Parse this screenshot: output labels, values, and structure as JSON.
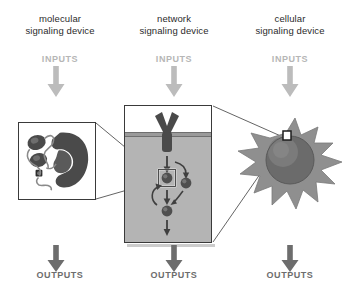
{
  "figure": {
    "background_color": "#ffffff",
    "columns": [
      {
        "key": "molecular",
        "title": "molecular\nsignaling device",
        "input_label": "INPUTS",
        "output_label": "OUTPUTS",
        "panel_name": "protein-structure-box"
      },
      {
        "key": "network",
        "title": "network\nsignaling device",
        "input_label": "INPUTS",
        "output_label": "OUTPUTS",
        "panel_name": "signaling-network-panel"
      },
      {
        "key": "cellular",
        "title": "cellular\nsignaling device",
        "input_label": "INPUTS",
        "output_label": "OUTPUTS",
        "panel_name": "cell-illustration"
      }
    ],
    "colors": {
      "title_text": "#2b2b2b",
      "inputs_text": "#b6b6b6",
      "outputs_text": "#6d6d6d",
      "inputs_arrow": "#bcbcbc",
      "outputs_arrow": "#6d6d6d",
      "panel_border": "#3a3a3a",
      "cytoplasm_fill": "#b4b4b4",
      "membrane_fill": "#9a9a9a",
      "molecule_fill": "#4a4a4a",
      "node_fill": "#4f4f4f",
      "cell_body_fill": "#8f8f8f",
      "nucleus_fill": "#6b6b6b",
      "connector_line": "#3c3c3c"
    },
    "elements": {
      "receptor": "Y-shaped membrane receptor",
      "membrane": "lipid bilayer band",
      "nodes": [
        "highlighted-node",
        "right-node",
        "lower-node"
      ],
      "highlight_box": "zoom-selection-square",
      "cell_marker": "zoom-selection-square",
      "nucleus": "nucleus-sphere",
      "protein": "protein-structure"
    }
  }
}
